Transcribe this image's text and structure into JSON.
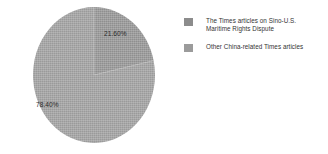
{
  "chart_data": {
    "type": "pie",
    "title": "",
    "subtitle": "",
    "xlabel": "",
    "ylabel": "",
    "grid": false,
    "legend_position": "right",
    "categories": [
      "The Times articles on Sino-U.S. Maritime Rights Dispute",
      "Other China-related Times articles"
    ],
    "values": [
      21.6,
      78.4
    ],
    "value_labels": [
      "21.60%",
      "78.40%"
    ],
    "slices": [
      {
        "label": "The Times articles on Sino-U.S. Maritime Rights Dispute",
        "value": 21.6,
        "display": "21.60%",
        "color": "#8f8f8f",
        "start_angle_deg": 0,
        "end_angle_deg": 77.76
      },
      {
        "label": "Other China-related Times articles",
        "value": 78.4,
        "display": "78.40%",
        "color": "#9a9a9a",
        "start_angle_deg": 77.76,
        "end_angle_deg": 360
      }
    ]
  },
  "legend": {
    "items": [
      {
        "label_line1": "The Times articles on Sino-U.S.",
        "label_line2": "Maritime Rights Dispute",
        "color": "#8c8c8c"
      },
      {
        "label_line1": "Other China-related Times articles",
        "label_line2": "",
        "color": "#9b9b9b"
      }
    ]
  },
  "colors": {
    "background": "#ffffff",
    "slice_small": "#8f8f8f",
    "slice_large": "#9a9a9a",
    "text": "#333333",
    "label_text": "#2b2b2b"
  }
}
